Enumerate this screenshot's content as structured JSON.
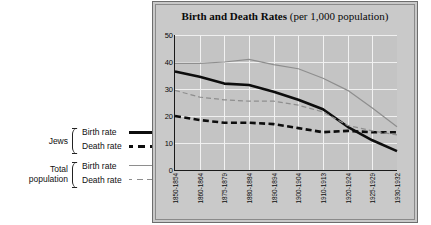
{
  "legend": {
    "groups": [
      {
        "name": "Jews",
        "rows": [
          {
            "label": "Birth rate",
            "style": "thick-solid-black"
          },
          {
            "label": "Death rate",
            "style": "thick-dashed-black"
          }
        ]
      },
      {
        "name": "Total population",
        "name_line1": "Total",
        "name_line2": "population",
        "rows": [
          {
            "label": "Birth rate",
            "style": "thin-solid-grey"
          },
          {
            "label": "Death rate",
            "style": "thin-dashed-grey"
          }
        ]
      }
    ]
  },
  "title": {
    "main": "Birth and Death Rates",
    "sub": " (per 1,000 population)"
  },
  "colors": {
    "panel_background": "#c9c9c9",
    "plot_background": "#c4c4c4",
    "gridline": "#efefef",
    "axis": "#1a1a1a",
    "jews_series": "#0d0d0d",
    "total_series": "#8e8e8e",
    "text": "#0a0a0a"
  },
  "chart_data": {
    "type": "line",
    "title": "Birth and Death Rates (per 1,000 population)",
    "xlabel": "",
    "ylabel": "",
    "ylim": [
      0,
      50
    ],
    "yticks": [
      0,
      10,
      20,
      30,
      40,
      50
    ],
    "grid": true,
    "legend_position": "left-outside",
    "categories": [
      "1850-1854",
      "1860-1864",
      "1875-1879",
      "1880-1884",
      "1890-1894",
      "1900-1904",
      "1910-1913",
      "1920-1924",
      "1925-1929",
      "1930-1932"
    ],
    "series": [
      {
        "name": "Jews Birth rate",
        "style": "thick-solid-black",
        "color": "#0d0d0d",
        "values": [
          36.5,
          34.5,
          32.0,
          31.5,
          29.0,
          26.0,
          22.5,
          16.0,
          11.0,
          7.0
        ]
      },
      {
        "name": "Jews Death rate",
        "style": "thick-dashed-black",
        "color": "#0d0d0d",
        "values": [
          20.0,
          18.5,
          17.5,
          17.5,
          17.0,
          15.5,
          14.0,
          14.5,
          14.0,
          14.0
        ]
      },
      {
        "name": "Total population Birth rate",
        "style": "thin-solid-grey",
        "color": "#8e8e8e",
        "values": [
          39.5,
          39.5,
          40.0,
          41.0,
          39.0,
          37.5,
          34.0,
          29.5,
          23.0,
          16.0
        ]
      },
      {
        "name": "Total population Death rate",
        "style": "thin-dashed-grey",
        "color": "#8e8e8e",
        "values": [
          29.5,
          27.0,
          26.0,
          25.5,
          25.5,
          24.0,
          21.5,
          16.5,
          14.5,
          13.0
        ]
      }
    ]
  }
}
